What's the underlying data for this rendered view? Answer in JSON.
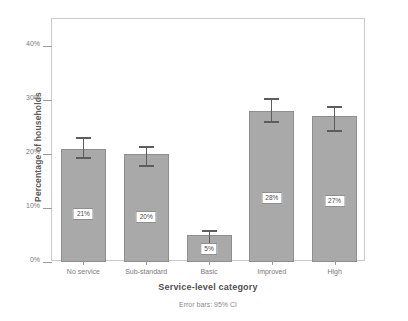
{
  "chart_data": {
    "type": "bar",
    "title": "",
    "subtitle": "",
    "xlabel": "Service-level category",
    "ylabel": "Percentage of households",
    "categories": [
      "No service",
      "Sub-standard",
      "Basic",
      "Improved",
      "High"
    ],
    "values": [
      21,
      20,
      5,
      28,
      27
    ],
    "value_labels": [
      "21%",
      "20%",
      "5%",
      "28%",
      "27%"
    ],
    "errors_low": [
      19.0,
      17.6,
      3.2,
      25.7,
      24.1
    ],
    "errors_high": [
      23.1,
      21.5,
      6.0,
      30.3,
      28.8
    ],
    "error_type": "95% CI",
    "annotation": "Error bars: 95% CI",
    "ylim": [
      0,
      45
    ],
    "yticks": [
      0,
      10,
      20,
      30,
      40
    ],
    "ytick_labels": [
      "0%",
      "10%",
      "20%",
      "30%",
      "40%"
    ],
    "grid": false,
    "legend": false,
    "bar_color": "#a9a9a9",
    "bar_edge_color": "#8e8e8e",
    "error_color": "#5d5d5d",
    "axis_color": "#c9c9c9",
    "text_color": "#7a7a7a",
    "background": "#ffffff"
  }
}
